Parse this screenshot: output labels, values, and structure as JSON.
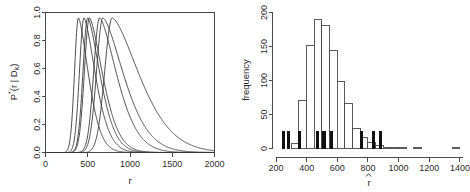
{
  "figure": {
    "panels": [
      "density-panel",
      "histogram-panel"
    ],
    "background": "#ffffff",
    "ink_color": "#3a3a3a",
    "rug_color": "#111111"
  },
  "chart_data": [
    {
      "type": "line",
      "name": "posterior-density-curves",
      "title": "",
      "xlabel": "r",
      "ylabel": "P*(r | D k)",
      "ylabel_parts": {
        "base": "P",
        "superscript": "*",
        "arg": "(r | D",
        "subscript": "k",
        "close": ")"
      },
      "xlim": [
        0,
        2000
      ],
      "ylim": [
        0,
        1.04
      ],
      "xticks": [
        0,
        500,
        1000,
        1500,
        2000
      ],
      "yticks": [
        0.0,
        0.2,
        0.4,
        0.6,
        0.8,
        1.0
      ],
      "ytick_labels": [
        "0.0",
        "0.2",
        "0.4",
        "0.6",
        "0.8",
        "1.0"
      ],
      "xtick_labels": [
        "0",
        "500",
        "1000",
        "1500",
        "2000"
      ],
      "grid": false,
      "legend": "none",
      "frame": "box",
      "n_curves": 7,
      "series": [
        {
          "name": "curve-1",
          "peak_x": 390,
          "peak_y": 1.0,
          "rise_width": 70,
          "decay_scale": 175,
          "onset_x": 260
        },
        {
          "name": "curve-2",
          "peak_x": 455,
          "peak_y": 1.0,
          "rise_width": 80,
          "decay_scale": 200,
          "onset_x": 300
        },
        {
          "name": "curve-3",
          "peak_x": 500,
          "peak_y": 1.0,
          "rise_width": 85,
          "decay_scale": 215,
          "onset_x": 330
        },
        {
          "name": "curve-4",
          "peak_x": 520,
          "peak_y": 1.0,
          "rise_width": 90,
          "decay_scale": 230,
          "onset_x": 345
        },
        {
          "name": "curve-5",
          "peak_x": 640,
          "peak_y": 1.0,
          "rise_width": 105,
          "decay_scale": 300,
          "onset_x": 420
        },
        {
          "name": "curve-6",
          "peak_x": 680,
          "peak_y": 1.0,
          "rise_width": 115,
          "decay_scale": 360,
          "onset_x": 450
        },
        {
          "name": "curve-7",
          "peak_x": 790,
          "peak_y": 1.0,
          "rise_width": 135,
          "decay_scale": 470,
          "onset_x": 530
        }
      ]
    },
    {
      "type": "bar",
      "name": "rhat-histogram",
      "title": "",
      "xlabel": "r (hat)",
      "ylabel": "frequency",
      "xlim": [
        200,
        1420
      ],
      "ylim": [
        0,
        205
      ],
      "xticks": [
        200,
        400,
        600,
        800,
        1000,
        1200,
        1400
      ],
      "xtick_labels": [
        "200",
        "400",
        "600",
        "800",
        "1000",
        "1200",
        "1400"
      ],
      "yticks": [
        0,
        50,
        100,
        150,
        200
      ],
      "ytick_labels": [
        "0",
        "50",
        "100",
        "150",
        "200"
      ],
      "grid": false,
      "legend": "none",
      "frame": "L-shaped",
      "bin_width": 50,
      "bin_starts": [
        250,
        300,
        350,
        400,
        450,
        500,
        550,
        600,
        650,
        700,
        750,
        800,
        850,
        900,
        950,
        1000,
        1050,
        1100,
        1150,
        1200,
        1250,
        1300,
        1350
      ],
      "values": [
        0,
        7,
        73,
        156,
        194,
        185,
        148,
        101,
        68,
        30,
        16,
        9,
        5,
        2,
        1,
        1,
        0,
        2,
        0,
        0,
        0,
        0,
        1
      ],
      "rug": {
        "name": "observed-rhat-rug",
        "height": 27,
        "positions": [
          247,
          252,
          281,
          287,
          352,
          358,
          470,
          476,
          510,
          520,
          556,
          562,
          755,
          762,
          835,
          842,
          879,
          886
        ]
      },
      "annotation": {
        "marker": "caret-under-axis",
        "x": 800
      }
    }
  ]
}
